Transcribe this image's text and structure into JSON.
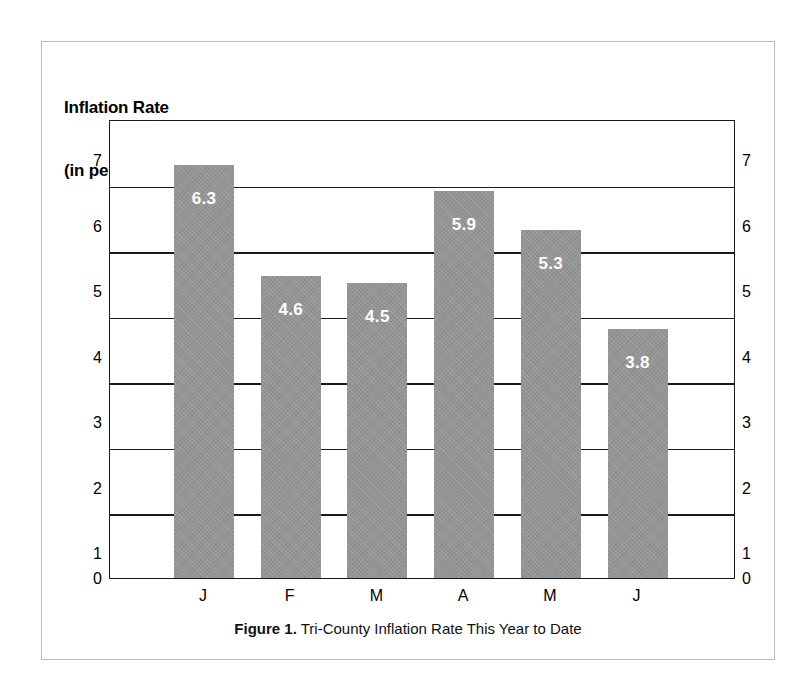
{
  "figure": {
    "title_line1": "Inflation Rate",
    "title_line2": "(in percent)",
    "caption_label": "Figure 1.",
    "caption_text": "Tri-County Inflation Rate This Year to Date",
    "bar_color": "#949494",
    "axis_color": "#1a1a1a",
    "frame_color": "#b9b9b9",
    "value_label_color": "#ffffff"
  },
  "chart_data": {
    "type": "bar",
    "title": "Inflation Rate (in percent)",
    "subtitle": "",
    "xlabel": "",
    "ylabel": "Inflation Rate (in percent)",
    "categories": [
      "J",
      "F",
      "M",
      "A",
      "M",
      "J"
    ],
    "category_names": [
      "January",
      "February",
      "March",
      "April",
      "May",
      "June"
    ],
    "values": [
      6.3,
      4.6,
      4.5,
      5.9,
      5.3,
      3.8
    ],
    "data_labels": [
      "6.3",
      "4.6",
      "4.5",
      "5.9",
      "5.3",
      "3.8"
    ],
    "ylim": [
      0,
      7
    ],
    "yticks": [
      0,
      1,
      2,
      3,
      4,
      5,
      6,
      7
    ],
    "ytick_labels_left": [
      "7",
      "6",
      "5",
      "4",
      "3",
      "2",
      "1",
      "0"
    ],
    "ytick_labels_right": [
      "7",
      "6",
      "5",
      "4",
      "3",
      "2",
      "1",
      "0"
    ],
    "grid": true,
    "grid_axis": "y",
    "legend": false,
    "legend_position": "none",
    "dual_axis": true
  }
}
